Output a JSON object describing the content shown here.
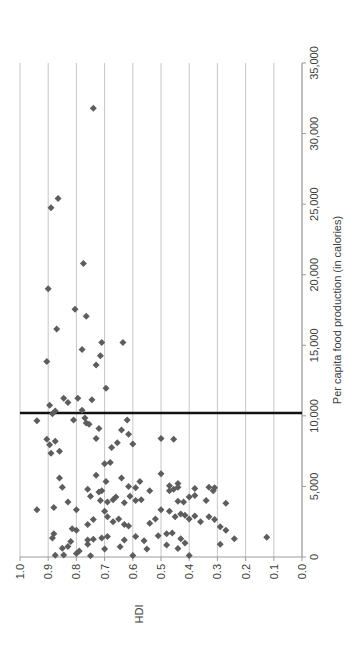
{
  "chart_data": {
    "type": "scatter",
    "title": "",
    "xlabel": "Per capita food production (in calories)",
    "ylabel": "HDI",
    "xlim": [
      0,
      35000
    ],
    "ylim": [
      0.0,
      1.0
    ],
    "x_tick_values": [
      0,
      5000,
      10000,
      15000,
      20000,
      25000,
      30000,
      35000
    ],
    "x_tick_labels": [
      "0",
      "5,000",
      "10,000",
      "15,000",
      "20,000",
      "25,000",
      "30,000",
      "35,000"
    ],
    "y_tick_values": [
      0.0,
      0.1,
      0.2,
      0.3,
      0.4,
      0.5,
      0.6,
      0.7,
      0.8,
      0.9,
      1.0
    ],
    "y_tick_labels": [
      "0.0",
      "0.1",
      "0.2",
      "0.3",
      "0.4",
      "0.5",
      "0.6",
      "0.7",
      "0.8",
      "0.9",
      "1.0"
    ],
    "grid": "y-gridlines only (every 0.1 HDI)",
    "legend": "none",
    "orientation": "whole chart rotated 90 degrees counter-clockwise in the screenshot",
    "reference_line": {
      "axis": "x",
      "value": 10200
    },
    "marker": {
      "shape": "diamond",
      "size_px": 7
    },
    "points": [
      [
        31800,
        0.74
      ],
      [
        25400,
        0.865
      ],
      [
        24750,
        0.89
      ],
      [
        20800,
        0.775
      ],
      [
        19000,
        0.9
      ],
      [
        17550,
        0.805
      ],
      [
        17050,
        0.765
      ],
      [
        16150,
        0.87
      ],
      [
        15200,
        0.71
      ],
      [
        15200,
        0.635
      ],
      [
        14700,
        0.78
      ],
      [
        14250,
        0.715
      ],
      [
        13600,
        0.73
      ],
      [
        13850,
        0.905
      ],
      [
        11950,
        0.695
      ],
      [
        11250,
        0.845
      ],
      [
        11250,
        0.795
      ],
      [
        11150,
        0.745
      ],
      [
        10950,
        0.83
      ],
      [
        10750,
        0.895
      ],
      [
        10400,
        0.78
      ],
      [
        10350,
        0.875
      ],
      [
        10150,
        0.885
      ],
      [
        9650,
        0.94
      ],
      [
        9700,
        0.81
      ],
      [
        9850,
        0.77
      ],
      [
        9500,
        0.765
      ],
      [
        9400,
        0.755
      ],
      [
        9700,
        0.62
      ],
      [
        9100,
        0.72
      ],
      [
        9000,
        0.64
      ],
      [
        8700,
        0.615
      ],
      [
        8400,
        0.73
      ],
      [
        8400,
        0.5
      ],
      [
        8350,
        0.455
      ],
      [
        8350,
        0.905
      ],
      [
        8200,
        0.875
      ],
      [
        7950,
        0.895
      ],
      [
        8100,
        0.655
      ],
      [
        7750,
        0.675
      ],
      [
        7500,
        0.86
      ],
      [
        7350,
        0.89
      ],
      [
        8000,
        0.6
      ],
      [
        6600,
        0.7
      ],
      [
        6700,
        0.68
      ],
      [
        5900,
        0.5
      ],
      [
        5800,
        0.73
      ],
      [
        5600,
        0.86
      ],
      [
        5600,
        0.64
      ],
      [
        5350,
        0.695
      ],
      [
        5350,
        0.575
      ],
      [
        5200,
        0.44
      ],
      [
        5050,
        0.47
      ],
      [
        5000,
        0.615
      ],
      [
        4950,
        0.85
      ],
      [
        4950,
        0.44
      ],
      [
        4950,
        0.33
      ],
      [
        4900,
        0.59
      ],
      [
        4850,
        0.38
      ],
      [
        4800,
        0.76
      ],
      [
        4800,
        0.455
      ],
      [
        4900,
        0.31
      ],
      [
        4700,
        0.71
      ],
      [
        4700,
        0.54
      ],
      [
        4700,
        0.47
      ],
      [
        4700,
        0.315
      ],
      [
        4600,
        0.72
      ],
      [
        4350,
        0.38
      ],
      [
        4300,
        0.75
      ],
      [
        4300,
        0.61
      ],
      [
        4250,
        0.66
      ],
      [
        4250,
        0.4
      ],
      [
        4050,
        0.67
      ],
      [
        4050,
        0.57
      ],
      [
        4000,
        0.715
      ],
      [
        4000,
        0.59
      ],
      [
        4000,
        0.34
      ],
      [
        3950,
        0.44
      ],
      [
        3900,
        0.83
      ],
      [
        3900,
        0.69
      ],
      [
        3900,
        0.42
      ],
      [
        3850,
        0.63
      ],
      [
        3800,
        0.27
      ],
      [
        3500,
        0.88
      ],
      [
        3350,
        0.94
      ],
      [
        3350,
        0.8
      ],
      [
        3350,
        0.5
      ],
      [
        3250,
        0.7
      ],
      [
        3250,
        0.47
      ],
      [
        3050,
        0.43
      ],
      [
        2950,
        0.415
      ],
      [
        2900,
        0.38
      ],
      [
        2850,
        0.69
      ],
      [
        2850,
        0.45
      ],
      [
        2850,
        0.33
      ],
      [
        2700,
        0.65
      ],
      [
        2700,
        0.52
      ],
      [
        2700,
        0.4
      ],
      [
        2650,
        0.74
      ],
      [
        2650,
        0.31
      ],
      [
        2500,
        0.67
      ],
      [
        2500,
        0.36
      ],
      [
        2400,
        0.54
      ],
      [
        2300,
        0.63
      ],
      [
        2300,
        0.76
      ],
      [
        2200,
        0.615
      ],
      [
        2150,
        0.29
      ],
      [
        2000,
        0.815
      ],
      [
        1900,
        0.8
      ],
      [
        1900,
        0.27
      ],
      [
        1650,
        0.88
      ],
      [
        1650,
        0.48
      ],
      [
        1700,
        0.46
      ],
      [
        1500,
        0.51
      ],
      [
        1450,
        0.59
      ],
      [
        1400,
        0.125
      ],
      [
        1350,
        0.885
      ],
      [
        1350,
        0.71
      ],
      [
        1450,
        0.69
      ],
      [
        1300,
        0.43
      ],
      [
        1300,
        0.24
      ],
      [
        1250,
        0.74
      ],
      [
        1200,
        0.76
      ],
      [
        1200,
        0.63
      ],
      [
        1150,
        0.56
      ],
      [
        1100,
        0.82
      ],
      [
        1000,
        0.415
      ],
      [
        900,
        0.76
      ],
      [
        900,
        0.29
      ],
      [
        850,
        0.48
      ],
      [
        750,
        0.83
      ],
      [
        730,
        0.645
      ],
      [
        620,
        0.85
      ],
      [
        600,
        0.44
      ],
      [
        570,
        0.7
      ],
      [
        570,
        0.55
      ],
      [
        430,
        0.79
      ],
      [
        250,
        0.8
      ],
      [
        150,
        0.845
      ],
      [
        120,
        0.875
      ],
      [
        100,
        0.4
      ],
      [
        100,
        0.6
      ],
      [
        80,
        0.75
      ]
    ]
  },
  "colors": {
    "marker": "#5d5d5d",
    "gridline": "#c6c6c6",
    "axis": "#9b9b9b",
    "reference_line": "#111111",
    "text": "#404040",
    "background": "#ffffff"
  }
}
